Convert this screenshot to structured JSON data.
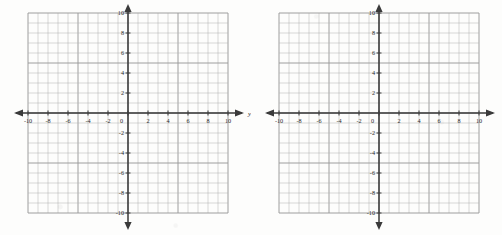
{
  "page": {
    "background_color": "#fdfdfc",
    "width": 502,
    "height": 235
  },
  "style": {
    "grid_color": "#b4b4b4",
    "grid_major_color": "#9a9a9a",
    "axis_color": "#3a3a3a",
    "label_color": "#2b2b2b"
  },
  "chart_data": [
    {
      "id": "graph-1",
      "type": "scatter",
      "title": "",
      "xlabel": "y",
      "ylabel": "",
      "xlim": [
        -10,
        10
      ],
      "ylim": [
        -10,
        10
      ],
      "grid": true,
      "grid_step": 1,
      "tick_step": 2,
      "legend": "none",
      "series": [],
      "x_tick_labels": [
        "-10",
        "-8",
        "-6",
        "-4",
        "-2",
        "0",
        "2",
        "4",
        "6",
        "8",
        "10"
      ],
      "y_tick_labels": [
        "10",
        "8",
        "6",
        "4",
        "2",
        "0",
        "-2",
        "-4",
        "-6",
        "-8",
        "-10"
      ],
      "x_tick_values": [
        -10,
        -8,
        -6,
        -4,
        -2,
        0,
        2,
        4,
        6,
        8,
        10
      ],
      "y_tick_values": [
        10,
        8,
        6,
        4,
        2,
        0,
        -2,
        -4,
        -6,
        -8,
        -10
      ],
      "axis_arrows": [
        "left",
        "right",
        "up",
        "down"
      ],
      "axis_label_right": "y"
    },
    {
      "id": "graph-2",
      "type": "scatter",
      "title": "",
      "xlabel": "",
      "ylabel": "",
      "xlim": [
        -10,
        10
      ],
      "ylim": [
        -10,
        10
      ],
      "grid": true,
      "grid_step": 1,
      "tick_step": 2,
      "legend": "none",
      "series": [],
      "x_tick_labels": [
        "-10",
        "-8",
        "-6",
        "-4",
        "-2",
        "0",
        "2",
        "4",
        "6",
        "8",
        "10"
      ],
      "y_tick_labels": [
        "10",
        "8",
        "6",
        "4",
        "2",
        "0",
        "-2",
        "-4",
        "-6",
        "-8",
        "-10"
      ],
      "x_tick_values": [
        -10,
        -8,
        -6,
        -4,
        -2,
        0,
        2,
        4,
        6,
        8,
        10
      ],
      "y_tick_values": [
        10,
        8,
        6,
        4,
        2,
        0,
        -2,
        -4,
        -6,
        -8,
        -10
      ],
      "axis_arrows": [
        "left",
        "right",
        "up",
        "down"
      ],
      "axis_label_right": ""
    }
  ]
}
